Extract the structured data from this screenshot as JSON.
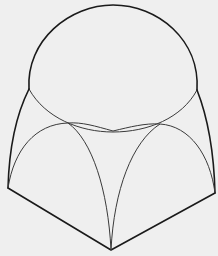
{
  "figure": {
    "title": "Dome over pendentives on a square bay",
    "background": "#efefef",
    "stroke_color": "#1a1a1a",
    "parts": {
      "dome": "hemispherical dome",
      "dome_base": "dome base ring",
      "pendentives": "spherical triangle pendentives",
      "base": "square base edges"
    }
  }
}
